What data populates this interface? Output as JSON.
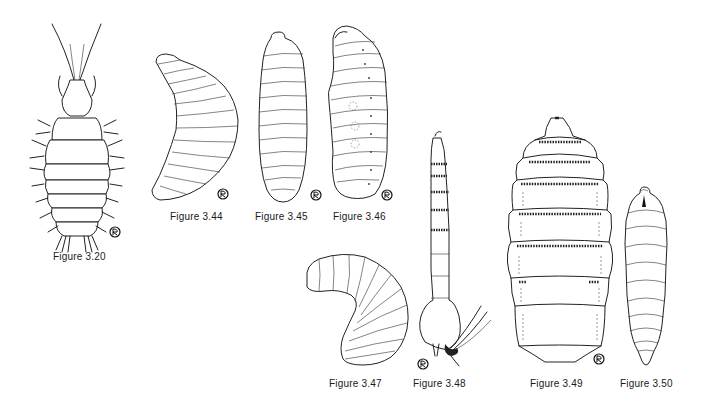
{
  "page": {
    "background": "#ffffff",
    "ink_color": "#222222"
  },
  "figures": [
    {
      "id": "3.20",
      "caption": "Figure 3.20",
      "subject": "setose larva, dorsal view with long antennae",
      "mark": "artist-signature-icon"
    },
    {
      "id": "3.44",
      "caption": "Figure 3.44",
      "subject": "curved maggot larva, lateral view",
      "mark": "artist-signature-icon"
    },
    {
      "id": "3.45",
      "caption": "Figure 3.45",
      "subject": "cylindrical maggot larva, dorsal view",
      "mark": "artist-signature-icon"
    },
    {
      "id": "3.46",
      "caption": "Figure 3.46",
      "subject": "maggot larva, lateral view with spiracles",
      "mark": "artist-signature-icon"
    },
    {
      "id": "3.47",
      "caption": "Figure 3.47",
      "subject": "C-shaped grub larva, lateral view",
      "mark": "artist-signature-icon"
    },
    {
      "id": "3.48",
      "caption": "Figure 3.48",
      "subject": "elongate rat-tailed larva with spiny bands",
      "mark": "artist-signature-icon"
    },
    {
      "id": "3.49",
      "caption": "Figure 3.49",
      "subject": "broad spiny-banded larva, dorsal view",
      "mark": "artist-signature-icon"
    },
    {
      "id": "3.50",
      "caption": "Figure 3.50",
      "subject": "tapered maggot larva, dorsal view",
      "mark": "none"
    }
  ]
}
